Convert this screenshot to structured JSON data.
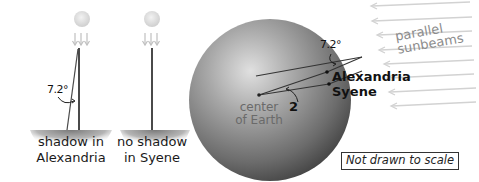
{
  "panels": {
    "alexandria": {
      "angle_label": "7.2°",
      "ground_label_line1": "shadow in",
      "ground_label_line2": "Alexandria"
    },
    "syene": {
      "ground_label_line1": "no shadow",
      "ground_label_line2": "in Syene"
    }
  },
  "earth": {
    "center_label_line1": "center",
    "center_label_line2": "of Earth",
    "angle_top_label": "7.2°",
    "angle_center_label": "2",
    "city1": "Alexandria",
    "city2": "Syene",
    "sunbeams_line1": "parallel",
    "sunbeams_line2": "sunbeams"
  },
  "note": "Not drawn to scale",
  "colors": {
    "sun": "#d9d9d9",
    "arrow": "#c8c8c8",
    "pole": "#4a4a4a",
    "earth_light": "#d6d6d6",
    "earth_dark": "#4a4a4a",
    "sunbeam": "#cfcfcf"
  }
}
